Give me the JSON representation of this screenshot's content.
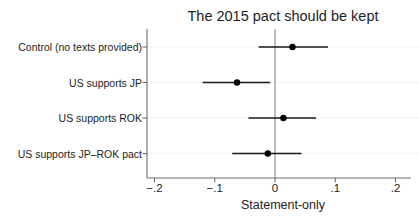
{
  "chart_data": {
    "type": "scatter",
    "subtype": "coefficient-dot-whisker-plot",
    "title": "The 2015 pact should be kept",
    "xlabel": "Statement-only",
    "ylabel": "",
    "xlim": [
      -0.2,
      0.2
    ],
    "xticks": [
      -0.2,
      -0.1,
      0,
      0.1,
      0.2
    ],
    "xticklabels": [
      "−.2",
      "−.1",
      "0",
      ".1",
      ".2"
    ],
    "grid": "faint-horizontal",
    "legend": "none",
    "zero_reference_line": 0,
    "categories": [
      "Control (no texts provided)",
      "US supports JP",
      "US supports ROK",
      "US supports JP–ROK pact"
    ],
    "values": [
      0.029,
      -0.063,
      0.014,
      -0.012
    ],
    "ci_low": [
      -0.027,
      -0.12,
      -0.044,
      -0.071
    ],
    "ci_high": [
      0.088,
      -0.008,
      0.068,
      0.044
    ],
    "points": [
      {
        "category": "Control (no texts provided)",
        "estimate": 0.029,
        "ci_low": -0.027,
        "ci_high": 0.088
      },
      {
        "category": "US supports JP",
        "estimate": -0.063,
        "ci_low": -0.12,
        "ci_high": -0.008
      },
      {
        "category": "US supports ROK",
        "estimate": 0.014,
        "ci_low": -0.044,
        "ci_high": 0.068
      },
      {
        "category": "US supports JP–ROK pact",
        "estimate": -0.012,
        "ci_low": -0.071,
        "ci_high": 0.044
      }
    ],
    "marker_color": "#000000",
    "line_color": "#1a1a1a"
  },
  "axis_geometry": {
    "x_pixel_at_min": 154.5,
    "x_pixel_at_max": 395.5,
    "row_y_pixels": [
      47,
      82.5,
      118,
      153.5
    ],
    "y_axis_x": 147,
    "y_axis_top": 29,
    "y_axis_bottom": 178
  }
}
